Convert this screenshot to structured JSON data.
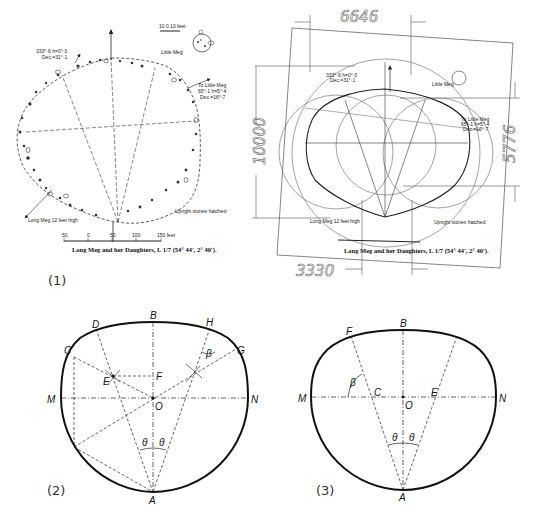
{
  "figure1": {
    "number_label": "(1)",
    "title": "Long Meg and her Daughters, L 1/7 (54° 44', 2° 40').",
    "annotation_top_left": [
      "333°·6 h=0°·3",
      "Dec.=31°·1"
    ],
    "annotation_right": [
      "To Little Meg",
      "65°·1 h=5°·4",
      "Dec.=16°·7"
    ],
    "little_meg_label": "Little Meg",
    "little_meg_scale": "10  0  10 feet",
    "long_meg_label": "Long Meg 12 feet high",
    "legend_note": "Upright stones hatched",
    "scale_ticks": [
      "50",
      "0",
      "50",
      "100",
      "150 feet"
    ]
  },
  "figure1b": {
    "dimension_top": "6646",
    "dimension_left": "10000",
    "dimension_right": "5776",
    "dimension_bottom": "3330",
    "title": "Long Meg and her Daughters, L 1/7 (54° 44', 2° 40').",
    "annotation_top_left": [
      "333°·6 h=0°·3",
      "Dec.=31°·1"
    ],
    "annotation_right": [
      "To Little Meg",
      "65°·1 h=5°·4",
      "Dec.=16°·7"
    ],
    "little_meg_label": "Little Meg",
    "long_meg_label": "Long Meg 12 feet high",
    "legend_note": "Upright stones hatched",
    "scale_ticks": [
      "50",
      "0",
      "50",
      "100",
      "150 feet"
    ]
  },
  "figure2": {
    "number_label": "(2)",
    "points": {
      "B": "B",
      "D": "D",
      "H": "H",
      "C": "C",
      "G": "G",
      "E": "E",
      "F": "F",
      "M": "M",
      "N": "N",
      "O": "O",
      "A": "A"
    },
    "angles": {
      "beta": "β",
      "theta_left": "θ",
      "theta_right": "θ"
    }
  },
  "figure3": {
    "number_label": "(3)",
    "points": {
      "B": "B",
      "F": "F",
      "C": "C",
      "E": "E",
      "M": "M",
      "N": "N",
      "O": "O",
      "A": "A"
    },
    "angles": {
      "beta": "β",
      "theta_left": "θ",
      "theta_right": "θ"
    }
  }
}
